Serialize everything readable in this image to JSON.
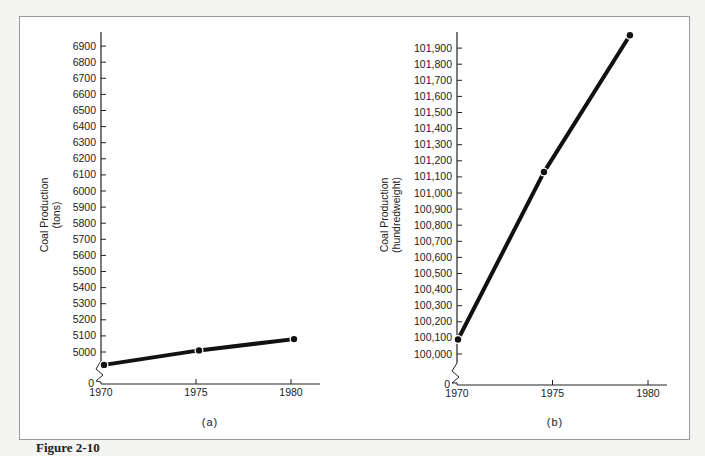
{
  "figure": {
    "caption": "Figure 2-10",
    "panels": [
      "(a)",
      "(b)"
    ]
  },
  "chart_data": [
    {
      "type": "line",
      "panel": "(a)",
      "title": "",
      "xlabel": "",
      "ylabel": "Coal Production (tons)",
      "ylabel_lines": [
        "Coal Production",
        "(tons)"
      ],
      "x_ticks": [
        "1970",
        "1975",
        "1980"
      ],
      "y_ticks": [
        "0",
        "5000",
        "5100",
        "5200",
        "5300",
        "5400",
        "5500",
        "5600",
        "5700",
        "5800",
        "5900",
        "6000",
        "6100",
        "6200",
        "6300",
        "6400",
        "6500",
        "6600",
        "6700",
        "6800",
        "6900"
      ],
      "axis_break": "between 0 and 5000",
      "x": [
        1970,
        1975,
        1980
      ],
      "values": [
        4920,
        5010,
        5080
      ],
      "ylim": [
        5000,
        6900
      ],
      "grid": false
    },
    {
      "type": "line",
      "panel": "(b)",
      "title": "",
      "xlabel": "",
      "ylabel": "Coal Production (hundredweight)",
      "ylabel_lines": [
        "Coal Production",
        "(hundredweight)"
      ],
      "x_ticks": [
        "1970",
        "1975",
        "1980"
      ],
      "y_ticks": [
        "0",
        "100,000",
        "100,100",
        "100,200",
        "100,300",
        "100,400",
        "100,500",
        "100,600",
        "100,700",
        "100,800",
        "100,900",
        "101,000",
        "101,100",
        "101,200",
        "101,300",
        "101,400",
        "101,500",
        "101,600",
        "101,700",
        "101,800",
        "101,900"
      ],
      "axis_break": "between 0 and 100,000",
      "x": [
        1970,
        1974.5,
        1979
      ],
      "values": [
        100090,
        101130,
        101980
      ],
      "ylim": [
        100000,
        101900
      ],
      "grid": false
    }
  ]
}
